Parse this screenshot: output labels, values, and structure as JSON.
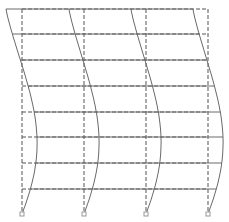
{
  "diagram": {
    "title": "",
    "type": "frame-deformation",
    "colors": {
      "original": "#555555",
      "deformed": "#777777",
      "support": "#999999",
      "background": "#ffffff"
    },
    "columns_x": [
      22,
      84,
      146,
      208
    ],
    "floor_levels_y": [
      9,
      34,
      60,
      86,
      112,
      137,
      163,
      189
    ],
    "base_y": 214,
    "deformed_columns": [
      {
        "top_x": 6,
        "bulge_x": 38,
        "bulge_y": 137
      },
      {
        "top_x": 69,
        "bulge_x": 100,
        "bulge_y": 137
      },
      {
        "top_x": 131,
        "bulge_x": 162,
        "bulge_y": 137
      },
      {
        "top_x": 193,
        "bulge_x": 224,
        "bulge_y": 137
      }
    ],
    "supports_count": 4,
    "legend": []
  }
}
